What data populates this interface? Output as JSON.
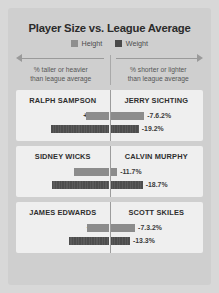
{
  "header": {
    "title": "Player Size vs. League Average",
    "legend": [
      {
        "label": "Height",
        "color": "#8c8c8c",
        "icon": "square-swatch-icon"
      },
      {
        "label": "Weight",
        "color": "#4d4d4d",
        "icon": "square-swatch-icon"
      }
    ],
    "axis_left": {
      "icon": "arrow-left-icon",
      "line1": "% taller or heavier",
      "line2": "than league average"
    },
    "axis_right": {
      "icon": "arrow-right-icon",
      "line1": "% shorter or lighter",
      "line2": "than league average"
    }
  },
  "chart_data": {
    "type": "bar",
    "title": "Player Size vs. League Average",
    "orientation": "horizontal-diverging",
    "center_value": 0,
    "xlabel": "",
    "ylabel": "",
    "xlim": [
      -20,
      12
    ],
    "grid": false,
    "legend_position": "top-center",
    "series": [
      {
        "name": "Height",
        "color": "#8c8c8c"
      },
      {
        "name": "Weight",
        "color": "#4d4d4d"
      }
    ],
    "annotations": {
      "left_direction": "% taller or heavier than league average",
      "right_direction": "% shorter or lighter than league average"
    },
    "cards": [
      {
        "left_player": {
          "name": "RALPH SAMPSON",
          "height_label": "+11.4%",
          "height_value": 11.4,
          "weight_label": "+9.6%",
          "weight_value": 9.6
        },
        "right_player": {
          "name": "JERRY SICHTING",
          "height_label": "-7.6.2%",
          "height_value": -7.6,
          "weight_label": "-19.2%",
          "weight_value": -19.2
        }
      },
      {
        "left_player": {
          "name": "SIDNEY WICKS",
          "height_label": "+2.5%",
          "height_value": 2.5,
          "weight_label": "+10.9%",
          "weight_value": 10.9
        },
        "right_player": {
          "name": "CALVIN MURPHY",
          "height_label": "-11.7%",
          "height_value": -11.7,
          "weight_label": "-18.7%",
          "weight_value": -18.7
        }
      },
      {
        "left_player": {
          "name": "JAMES EDWARDS",
          "height_label": "+8.4%",
          "height_value": 8.4,
          "weight_label": "+6.7%",
          "weight_value": 6.7
        },
        "right_player": {
          "name": "SCOTT SKILES",
          "height_label": "-7.3.2%",
          "height_value": -7.3,
          "weight_label": "-13.3%",
          "weight_value": -13.3
        }
      }
    ]
  }
}
